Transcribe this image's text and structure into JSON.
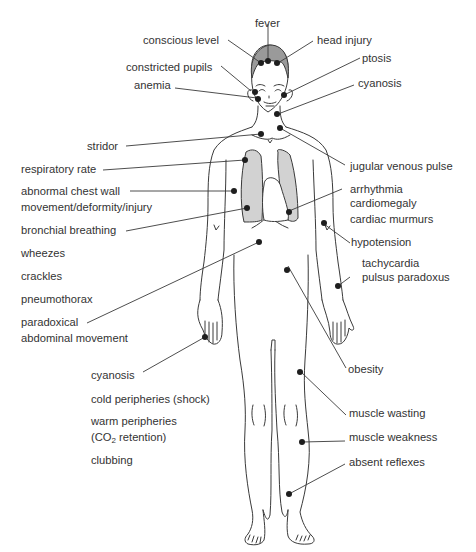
{
  "diagram": {
    "title": "",
    "colors": {
      "line": "#3a3a3a",
      "dot": "#1e1e1e",
      "hair": "#9a9a9a",
      "lungs": "#d2d2d2",
      "text": "#333333"
    },
    "labels": {
      "fever": "fever",
      "conscious_level": "conscious level",
      "head_injury": "head injury",
      "constricted_pupils": "constricted pupils",
      "ptosis": "ptosis",
      "anemia": "anemia",
      "cyanosis_face": "cyanosis",
      "stridor": "stridor",
      "respiratory_rate": "respiratory rate",
      "jugular_venous_pulse": "jugular venous pulse",
      "abnormal_chest_wall_1": "abnormal chest wall",
      "abnormal_chest_wall_2": "movement/deformity/injury",
      "arrhythmia": "arrhythmia",
      "cardiomegaly": "cardiomegaly",
      "cardiac_murmurs": "cardiac murmurs",
      "bronchial_breathing": "bronchial breathing",
      "hypotension": "hypotension",
      "wheezes": "wheezes",
      "tachycardia": "tachycardia",
      "pulsus_paradoxus": "pulsus paradoxus",
      "crackles": "crackles",
      "pneumothorax": "pneumothorax",
      "paradoxical_1": "paradoxical",
      "paradoxical_2": "abdominal movement",
      "cyanosis_hand": "cyanosis",
      "obesity": "obesity",
      "cold_peripheries": "cold peripheries (shock)",
      "muscle_wasting": "muscle wasting",
      "warm_peripheries_1": "warm peripheries",
      "warm_peripheries_2_pre": "(CO",
      "warm_peripheries_2_sub": "2",
      "warm_peripheries_2_post": " retention)",
      "muscle_weakness": "muscle weakness",
      "clubbing": "clubbing",
      "absent_reflexes": "absent reflexes"
    }
  }
}
